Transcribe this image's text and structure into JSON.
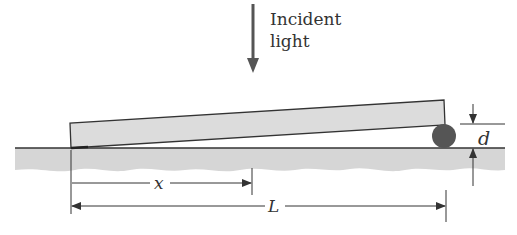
{
  "incident_light": {
    "line1": "Incident",
    "line2": "light"
  },
  "labels": {
    "separation": "x",
    "length": "L",
    "thickness": "d"
  },
  "colors": {
    "plate_fill": "#dcdcdc",
    "ground_fill": "#d6d6d6",
    "line": "#333333",
    "sphere": "#555555",
    "background": "#ffffff"
  }
}
